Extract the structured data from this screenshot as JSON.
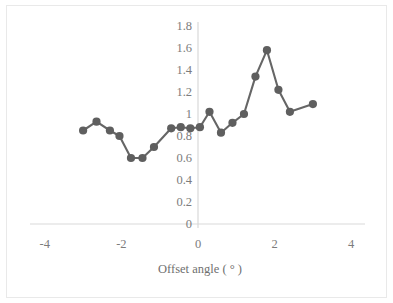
{
  "chart_data": {
    "type": "line",
    "title": "",
    "subtitle": "",
    "xlabel": "Offset angle ( ° )",
    "ylabel": "Distance (m)",
    "xlim": [
      -4,
      4
    ],
    "ylim": [
      0,
      1.8
    ],
    "xticks": [
      "-4",
      "-2",
      "0",
      "2",
      "4"
    ],
    "xtick_values": [
      -4,
      -2,
      0,
      2,
      4
    ],
    "yticks": [
      "0",
      "0.2",
      "0.4",
      "0.6",
      "0.8",
      "1",
      "1.2",
      "1.4",
      "1.6",
      "1.8"
    ],
    "ytick_values": [
      0,
      0.2,
      0.4,
      0.6,
      0.8,
      1,
      1.2,
      1.4,
      1.6,
      1.8
    ],
    "grid": false,
    "legend": null,
    "series": [
      {
        "name": "Distance",
        "color": "#666666",
        "marker": "circle",
        "x": [
          -3.0,
          -2.65,
          -2.3,
          -2.05,
          -1.75,
          -1.45,
          -1.15,
          -0.7,
          -0.45,
          -0.2,
          0.05,
          0.3,
          0.6,
          0.9,
          1.2,
          1.5,
          1.8,
          2.1,
          2.4,
          3.0
        ],
        "y": [
          0.85,
          0.93,
          0.85,
          0.8,
          0.6,
          0.6,
          0.7,
          0.87,
          0.88,
          0.87,
          0.88,
          1.02,
          0.83,
          0.92,
          1.0,
          1.34,
          1.58,
          1.22,
          1.02,
          1.09
        ]
      }
    ],
    "colors": {
      "line": "#666666",
      "marker": "#5f5f5f",
      "axis": "#d6d6d6",
      "tick_text": "#7c7c7c",
      "frame": "#e9e9e9",
      "background": "#ffffff"
    }
  }
}
